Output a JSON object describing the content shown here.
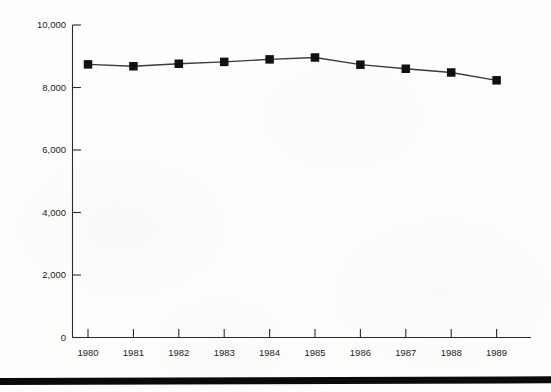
{
  "chart_data": {
    "type": "line",
    "title": "",
    "subtitle": "",
    "xlabel": "",
    "ylabel": "",
    "categories": [
      "1980",
      "1981",
      "1982",
      "1983",
      "1984",
      "1985",
      "1986",
      "1987",
      "1988",
      "1989"
    ],
    "values": [
      8740,
      8680,
      8760,
      8820,
      8900,
      8960,
      8730,
      8600,
      8480,
      8230
    ],
    "series": [
      {
        "name": "series-1",
        "values": [
          8740,
          8680,
          8760,
          8820,
          8900,
          8960,
          8730,
          8600,
          8480,
          8230
        ],
        "marker": "filled-square",
        "color": "#111111",
        "line_color": "#3a3a3a"
      }
    ],
    "ylim": [
      0,
      10000
    ],
    "y_ticks": [
      0,
      2000,
      4000,
      6000,
      8000,
      10000
    ],
    "y_tick_labels": [
      "0",
      "2,000",
      "4,000",
      "6,000",
      "8,000",
      "10,000"
    ],
    "x_ticks": [
      "1980",
      "1981",
      "1982",
      "1983",
      "1984",
      "1985",
      "1986",
      "1987",
      "1988",
      "1989"
    ],
    "grid": false,
    "legend": "none",
    "annotations": []
  },
  "axes": {
    "y_axis_name": "value-axis",
    "x_axis_name": "year-axis"
  },
  "decor": {
    "bottom_rule_label": "bottom-rule"
  }
}
